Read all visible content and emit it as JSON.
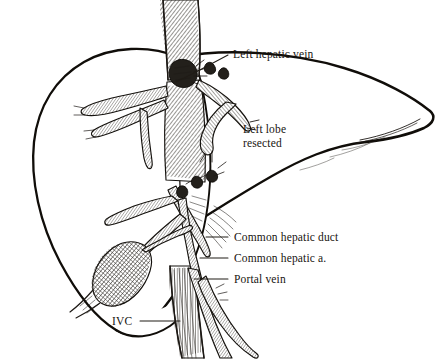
{
  "figure": {
    "background_color": "#ffffff",
    "ink_color": "#17140f",
    "style": "pen-and-ink crosshatch line drawing"
  },
  "labels": [
    {
      "id": "left-hepatic-vein",
      "text": "Left hepatic vein",
      "text_x": 233,
      "text_y": 58,
      "anchor": "start",
      "leader": "M 228 55 L 196 72 L 176 82",
      "lines": [
        "Left hepatic vein"
      ]
    },
    {
      "id": "left-lobe-resected",
      "text": "Left lobe resected",
      "text_x": 243,
      "text_y": 136,
      "anchor": "start",
      "leader": "",
      "lines": [
        "Left lobe",
        "resected"
      ]
    },
    {
      "id": "common-hepatic-duct",
      "text": "Common hepatic duct",
      "text_x": 234,
      "text_y": 241,
      "anchor": "start",
      "leader": "M 228 237 L 206 237",
      "lines": [
        "Common hepatic duct"
      ]
    },
    {
      "id": "common-hepatic-artery",
      "text": "Common hepatic a.",
      "text_x": 234,
      "text_y": 262,
      "anchor": "start",
      "leader": "M 228 258 L 200 258",
      "lines": [
        "Common hepatic a."
      ]
    },
    {
      "id": "portal-vein",
      "text": "Portal vein",
      "text_x": 234,
      "text_y": 283,
      "anchor": "start",
      "leader": "M 228 279 L 194 279",
      "lines": [
        "Portal vein"
      ]
    },
    {
      "id": "ivc",
      "text": "IVC",
      "text_x": 112,
      "text_y": 325,
      "anchor": "start",
      "leader": "M 140 321 L 178 321",
      "lines": [
        "IVC"
      ]
    }
  ],
  "anatomy": [
    {
      "id": "liver-right-lobe",
      "name": "Right lobe of liver"
    },
    {
      "id": "inferior-vena-cava",
      "name": "Inferior vena cava"
    },
    {
      "id": "hepatic-vein-stump",
      "name": "Ligated left hepatic vein stump"
    },
    {
      "id": "hepatic-vein-branches",
      "name": "Hepatic vein tributaries"
    },
    {
      "id": "gallbladder",
      "name": "Gallbladder"
    },
    {
      "id": "portal-triad",
      "name": "Portal triad structures"
    },
    {
      "id": "resection-margin",
      "name": "Cut surface / resection margin"
    }
  ]
}
